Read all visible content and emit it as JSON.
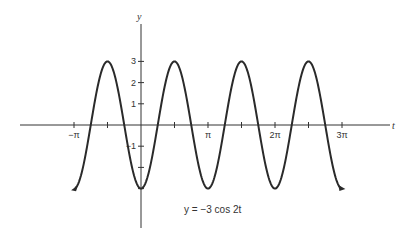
{
  "chart_data": {
    "type": "line",
    "title": "",
    "equation_label": "y = −3 cos 2t",
    "xlabel": "t",
    "ylabel": "y",
    "function": "y = -3*cos(2*t)",
    "xlim": [
      -3.14159,
      9.5
    ],
    "ylim": [
      -3,
      3
    ],
    "x_ticks": [
      {
        "value": -3.14159,
        "label": "−π"
      },
      {
        "value": -1.5708,
        "label": ""
      },
      {
        "value": 1.5708,
        "label": ""
      },
      {
        "value": 3.14159,
        "label": "π"
      },
      {
        "value": 4.7124,
        "label": ""
      },
      {
        "value": 6.28319,
        "label": "2π"
      },
      {
        "value": 7.854,
        "label": ""
      },
      {
        "value": 9.42478,
        "label": "3π"
      }
    ],
    "y_ticks": [
      {
        "value": 3,
        "label": "3"
      },
      {
        "value": 2,
        "label": "2"
      },
      {
        "value": 1,
        "label": "1"
      },
      {
        "value": -1,
        "label": "−1"
      },
      {
        "value": -2,
        "label": ""
      },
      {
        "value": -3,
        "label": ""
      }
    ],
    "series": [
      {
        "name": "y = −3 cos 2t",
        "x": [
          -3.14159,
          -2.356,
          -1.5708,
          -0.785,
          0,
          0.785,
          1.5708,
          2.356,
          3.14159,
          3.927,
          4.7124,
          5.498,
          6.28319,
          7.069,
          7.854,
          8.639,
          9.42478
        ],
        "values": [
          -3,
          0,
          3,
          0,
          -3,
          0,
          3,
          0,
          -3,
          0,
          3,
          0,
          -3,
          0,
          3,
          0,
          -3
        ]
      }
    ],
    "grid": false,
    "legend": "none",
    "arrows_on_curve_ends": true
  },
  "layout": {
    "origin_px": [
      141,
      125
    ],
    "px_per_pi": 67,
    "px_per_unit_y": 21.2,
    "t_axis_px": [
      20,
      390
    ],
    "y_axis_px": [
      20,
      228
    ],
    "colors": {
      "ink": "#2a2a2a",
      "background": "#ffffff"
    }
  }
}
